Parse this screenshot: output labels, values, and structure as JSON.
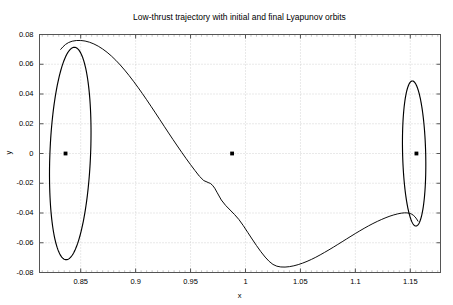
{
  "chart_data": {
    "type": "line",
    "title": "Low-thrust trajectory with initial and final Lyapunov orbits",
    "xlabel": "x",
    "ylabel": "y",
    "xlim": [
      0.8125,
      1.1775
    ],
    "ylim": [
      -0.08,
      0.08
    ],
    "grid": true,
    "legend": null,
    "xticks": [
      0.85,
      0.9,
      0.95,
      1,
      1.05,
      1.1,
      1.15
    ],
    "xtick_labels": [
      "0.85",
      "0.9",
      "0.95",
      "1",
      "1.05",
      "1.1",
      "1.15"
    ],
    "yticks": [
      -0.08,
      -0.06,
      -0.04,
      -0.02,
      0,
      0.02,
      0.04,
      0.06,
      0.08
    ],
    "ytick_labels": [
      "-0.08",
      "-0.06",
      "-0.04",
      "-0.02",
      "0",
      "0.02",
      "0.04",
      "0.06",
      "0.08"
    ],
    "line_color": "#000000",
    "grid_color": "#c8c8c8",
    "axes_color": "#555555",
    "background": "#ffffff",
    "series": [
      {
        "name": "initial-lyapunov-orbit-l1",
        "type": "closed-curve",
        "center_x": 0.8405,
        "center_y": 0.0,
        "semi_x": 0.0185,
        "semi_y": 0.0715,
        "tilt_deg": -3.2,
        "comment": "tall narrow ellipse about L1, y from -0.0715 to +0.0715"
      },
      {
        "name": "final-lyapunov-orbit-l2",
        "type": "closed-curve",
        "center_x": 1.1535,
        "center_y": 0.0,
        "semi_x": 0.0105,
        "semi_y": 0.0488,
        "tilt_deg": 2.0,
        "comment": "tall narrow ellipse about L2, y from -0.0488 to +0.0488"
      },
      {
        "name": "low-thrust-transfer-trajectory",
        "type": "open-curve",
        "points": [
          [
            0.8318,
            0.07
          ],
          [
            0.836,
            0.0735
          ],
          [
            0.842,
            0.0757
          ],
          [
            0.85,
            0.0762
          ],
          [
            0.858,
            0.075
          ],
          [
            0.866,
            0.0723
          ],
          [
            0.874,
            0.0682
          ],
          [
            0.882,
            0.0628
          ],
          [
            0.89,
            0.0562
          ],
          [
            0.898,
            0.0487
          ],
          [
            0.906,
            0.0405
          ],
          [
            0.914,
            0.0318
          ],
          [
            0.922,
            0.0228
          ],
          [
            0.93,
            0.0138
          ],
          [
            0.938,
            0.005
          ],
          [
            0.946,
            -0.0035
          ],
          [
            0.954,
            -0.0115
          ],
          [
            0.962,
            -0.019
          ],
          [
            0.97,
            -0.02
          ],
          [
            0.978,
            -0.032
          ],
          [
            0.986,
            -0.038
          ],
          [
            0.994,
            -0.044
          ],
          [
            1.002,
            -0.053
          ],
          [
            1.01,
            -0.062
          ],
          [
            1.018,
            -0.07
          ],
          [
            1.025,
            -0.075
          ],
          [
            1.032,
            -0.0765
          ],
          [
            1.04,
            -0.0762
          ],
          [
            1.048,
            -0.0748
          ],
          [
            1.056,
            -0.0726
          ],
          [
            1.064,
            -0.0698
          ],
          [
            1.072,
            -0.0665
          ],
          [
            1.08,
            -0.063
          ],
          [
            1.088,
            -0.0593
          ],
          [
            1.096,
            -0.0556
          ],
          [
            1.104,
            -0.052
          ],
          [
            1.112,
            -0.0486
          ],
          [
            1.12,
            -0.0456
          ],
          [
            1.128,
            -0.043
          ],
          [
            1.135,
            -0.0412
          ],
          [
            1.142,
            -0.04
          ],
          [
            1.147,
            -0.0398
          ],
          [
            1.151,
            -0.0405
          ],
          [
            1.1545,
            -0.0425
          ],
          [
            1.157,
            -0.0455
          ]
        ],
        "comment": "spiral transfer arc from L1 orbit over the top, down past the Moon, and into the L2 orbit"
      }
    ],
    "markers": [
      {
        "name": "L1",
        "label": "L",
        "sublabel": "1",
        "x": 0.8362,
        "y": 0.0,
        "marker": "square",
        "color": "#000000"
      },
      {
        "name": "Moon",
        "label": "Moon",
        "sublabel": "",
        "x": 0.9878,
        "y": 0.0,
        "marker": "square",
        "color": "#000000"
      },
      {
        "name": "L2",
        "label": "L",
        "sublabel": "2",
        "x": 1.1556,
        "y": 0.0,
        "marker": "square",
        "color": "#000000"
      }
    ]
  }
}
